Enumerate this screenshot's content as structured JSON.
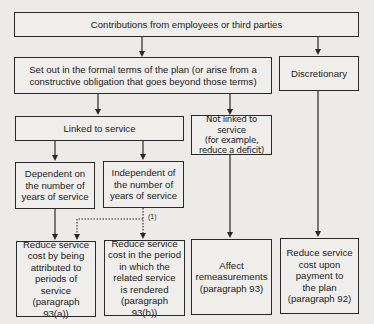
{
  "diagram": {
    "top": {
      "label": "Contributions from employees or third parties"
    },
    "formal_terms": {
      "label": "Set out in the formal terms of the plan (or arise from a\nconstructive obligation that goes beyond those terms)"
    },
    "discretionary": {
      "label": "Discretionary"
    },
    "linked": {
      "label": "Linked to service"
    },
    "not_linked": {
      "label": "Not linked to service\n(for example,\nreduce a deficit)"
    },
    "dependent": {
      "label": "Dependent on\nthe number of\nyears of service"
    },
    "independent": {
      "label": "Independent of\nthe number of\nyears of service"
    },
    "outcome_a": {
      "label": "Reduce service\ncost by being\nattributed to\nperiods of service\n(paragraph 93(a))"
    },
    "outcome_b": {
      "label": "Reduce service\ncost in the period\nin which the\nrelated service\nis rendered\n(paragraph 93(b))"
    },
    "outcome_c": {
      "label": "Affect\nremeasurements\n(paragraph 93)"
    },
    "outcome_d": {
      "label": "Reduce service\ncost upon\npayment to\nthe plan\n(paragraph 92)"
    },
    "dotted_note": "(1)"
  },
  "colors": {
    "line": "#2a2a2a",
    "background": "#ecebe8"
  }
}
